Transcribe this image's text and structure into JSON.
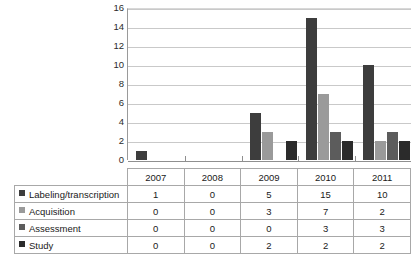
{
  "chart_data": {
    "type": "bar",
    "title": "",
    "subtitle": "",
    "xlabel": "",
    "ylabel": "",
    "categories": [
      "2007",
      "2008",
      "2009",
      "2010",
      "2011"
    ],
    "series": [
      {
        "name": "Labeling/transcription",
        "values": [
          1,
          0,
          5,
          15,
          10
        ],
        "color": "#3d3d3d"
      },
      {
        "name": "Acquisition",
        "values": [
          0,
          0,
          3,
          7,
          2
        ],
        "color": "#9a9a9a"
      },
      {
        "name": "Assessment",
        "values": [
          0,
          0,
          0,
          3,
          3
        ],
        "color": "#5c5c5c"
      },
      {
        "name": "Study",
        "values": [
          0,
          0,
          2,
          2,
          2
        ],
        "color": "#2b2b2b"
      }
    ],
    "ylim": [
      0,
      16
    ],
    "yticks": [
      0,
      2,
      4,
      6,
      8,
      10,
      12,
      14,
      16
    ],
    "ytick_labels": [
      "0",
      "2",
      "4",
      "6",
      "8",
      "10",
      "12",
      "14",
      "16"
    ],
    "grid": true,
    "grid_axis": "y",
    "legend_position": "table-row-headers",
    "has_data_table": true
  },
  "table": {
    "corner_label": "",
    "column_headers": [
      "2007",
      "2008",
      "2009",
      "2010",
      "2011"
    ],
    "rows": [
      {
        "label": "Labeling/transcription",
        "values": [
          "1",
          "0",
          "5",
          "15",
          "10"
        ]
      },
      {
        "label": "Acquisition",
        "values": [
          "0",
          "0",
          "3",
          "7",
          "2"
        ]
      },
      {
        "label": "Assessment",
        "values": [
          "0",
          "0",
          "0",
          "3",
          "3"
        ]
      },
      {
        "label": "Study",
        "values": [
          "0",
          "0",
          "2",
          "2",
          "2"
        ]
      }
    ]
  },
  "colors": {
    "series_1": "#3d3d3d",
    "series_2": "#9a9a9a",
    "series_3": "#5c5c5c",
    "series_4": "#2b2b2b",
    "gridline": "#c9c9c9",
    "axis": "#8f8f8f",
    "table_border": "#a8a8a8",
    "background": "#ffffff"
  }
}
